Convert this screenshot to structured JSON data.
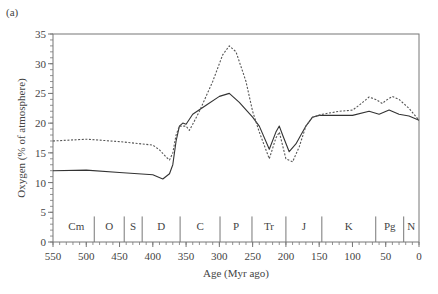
{
  "panel_label": "(a)",
  "chart_data": {
    "type": "line",
    "title": "",
    "panel": "(a)",
    "xlabel": "Age (Myr ago)",
    "ylabel": "Oxygen (% of atmosphere)",
    "xlim": [
      550,
      0
    ],
    "ylim": [
      0,
      35
    ],
    "x_reversed": true,
    "grid": false,
    "legend": null,
    "x_ticks": [
      550,
      500,
      450,
      400,
      350,
      300,
      250,
      200,
      150,
      100,
      50,
      0
    ],
    "x_minor_step": 10,
    "y_ticks": [
      0,
      5,
      10,
      15,
      20,
      25,
      30,
      35
    ],
    "y_minor_step": 1,
    "series": [
      {
        "name": "solid",
        "style": "solid",
        "color": "#333333",
        "x": [
          550,
          500,
          450,
          400,
          385,
          375,
          370,
          365,
          360,
          355,
          350,
          340,
          320,
          300,
          285,
          270,
          250,
          240,
          225,
          215,
          210,
          205,
          195,
          185,
          170,
          160,
          150,
          120,
          100,
          75,
          60,
          45,
          30,
          15,
          0
        ],
        "y": [
          12,
          12.1,
          11.7,
          11.3,
          10.6,
          11.5,
          13,
          17,
          19.5,
          20,
          19.8,
          21.5,
          23,
          24.5,
          25,
          23.5,
          21,
          19.5,
          15.6,
          18.5,
          19.5,
          18,
          15.2,
          16.5,
          19.5,
          21,
          21.3,
          21.3,
          21.3,
          22,
          21.5,
          22.2,
          21.5,
          21.2,
          20.5
        ]
      },
      {
        "name": "dashed",
        "style": "dashed",
        "color": "#555555",
        "x": [
          550,
          500,
          450,
          400,
          390,
          380,
          375,
          370,
          365,
          360,
          350,
          345,
          340,
          330,
          310,
          295,
          285,
          275,
          260,
          250,
          240,
          225,
          215,
          210,
          200,
          190,
          180,
          170,
          160,
          145,
          120,
          100,
          90,
          75,
          65,
          55,
          50,
          40,
          30,
          15,
          0
        ],
        "y": [
          17,
          17.3,
          16.9,
          16.3,
          15.5,
          14.3,
          13.8,
          15,
          18,
          19.5,
          19.5,
          18.8,
          19.8,
          22,
          27,
          31.5,
          33,
          32,
          27,
          22,
          18.5,
          14,
          17.5,
          18.5,
          14,
          13.5,
          16,
          19.5,
          21,
          21.5,
          22,
          22.2,
          23,
          24.4,
          24,
          23.3,
          23.8,
          24.5,
          24,
          22.5,
          20.5
        ]
      }
    ],
    "periods": [
      {
        "label": "Cm",
        "start": 542,
        "end": 488
      },
      {
        "label": "O",
        "start": 488,
        "end": 443
      },
      {
        "label": "S",
        "start": 443,
        "end": 416
      },
      {
        "label": "D",
        "start": 416,
        "end": 359
      },
      {
        "label": "C",
        "start": 359,
        "end": 299
      },
      {
        "label": "P",
        "start": 299,
        "end": 251
      },
      {
        "label": "Tr",
        "start": 251,
        "end": 200
      },
      {
        "label": "J",
        "start": 200,
        "end": 146
      },
      {
        "label": "K",
        "start": 146,
        "end": 65
      },
      {
        "label": "Pg",
        "start": 65,
        "end": 23
      },
      {
        "label": "N",
        "start": 23,
        "end": 0
      }
    ],
    "period_boundaries": [
      488,
      443,
      416,
      359,
      299,
      251,
      200,
      146,
      65,
      23
    ]
  }
}
